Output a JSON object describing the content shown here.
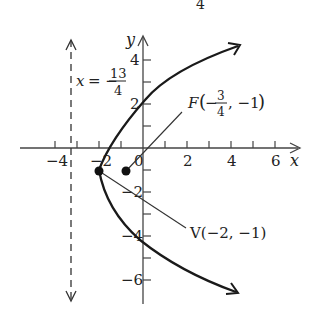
{
  "diagram": {
    "type": "parabola-graph",
    "equation": "(y+1)^2 = 5(x+2)",
    "top_fragment": "4",
    "axes": {
      "x_label": "x",
      "y_label": "y",
      "x_ticks": [
        "−4",
        "−2",
        "0",
        "2",
        "4",
        "6"
      ],
      "y_ticks": [
        "4",
        "2",
        "−2",
        "−4",
        "−6"
      ],
      "x_range": [
        -4.5,
        7
      ],
      "y_range": [
        -7,
        5
      ]
    },
    "directrix": {
      "label_prefix": "x = −",
      "label_num": "13",
      "label_den": "4",
      "value": -3.25,
      "style": "dashed"
    },
    "focus": {
      "label_prefix": "F",
      "label_open": "(−",
      "label_num": "3",
      "label_den": "4",
      "label_rest": ", −1)",
      "x": -0.75,
      "y": -1
    },
    "vertex": {
      "label": "V(−2, −1)",
      "x": -2,
      "y": -1
    },
    "colors": {
      "curve": "#1a1a1a",
      "axes": "#444444",
      "text": "#222222",
      "background": "#ffffff"
    }
  }
}
